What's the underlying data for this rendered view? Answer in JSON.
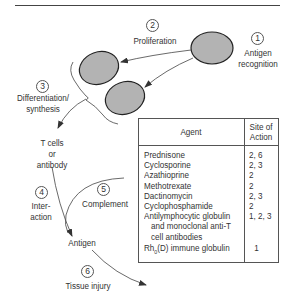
{
  "steps": [
    {
      "number": "1",
      "label": "Antigen recognition",
      "lines": [
        "Antigen",
        "recognition"
      ]
    },
    {
      "number": "2",
      "label": "Proliferation",
      "lines": [
        "Proliferation"
      ]
    },
    {
      "number": "3",
      "label": "Differentiation/ synthesis",
      "lines": [
        "Differentiation/",
        "synthesis"
      ]
    },
    {
      "number": "4",
      "label": "Inter-action",
      "lines": [
        "Inter-",
        "action"
      ]
    },
    {
      "number": "5",
      "label": "Complement",
      "lines": [
        "Complement"
      ]
    },
    {
      "number": "6",
      "label": "Tissue injury",
      "lines": [
        "Tissue injury"
      ]
    }
  ],
  "nodes": {
    "tcells": [
      "T cells",
      "or",
      "antibody"
    ],
    "antigen": "Antigen"
  },
  "colors": {
    "cell_fill": "#b3b3b3",
    "cell_stroke": "#222222",
    "line": "#444444"
  },
  "table": {
    "headers": {
      "agent": "Agent",
      "site": [
        "Site of",
        "Action"
      ]
    },
    "rows": [
      {
        "agent": "Prednisone",
        "site": "2, 6"
      },
      {
        "agent": "Cyclosporine",
        "site": "2, 3"
      },
      {
        "agent": "Azathioprine",
        "site": "2"
      },
      {
        "agent": "Methotrexate",
        "site": "2"
      },
      {
        "agent": "Dactinomycin",
        "site": "2, 3"
      },
      {
        "agent": "Cyclophosphamide",
        "site": "2"
      },
      {
        "agent": "Antilymphocytic globulin",
        "agent_cont": [
          "and monoclonal anti-T",
          "cell antibodies"
        ],
        "site": "1, 2, 3"
      },
      {
        "agent_prefix": "Rh",
        "agent_sub": "0",
        "agent_suffix": "(D) immune globulin",
        "site": "1"
      }
    ]
  }
}
